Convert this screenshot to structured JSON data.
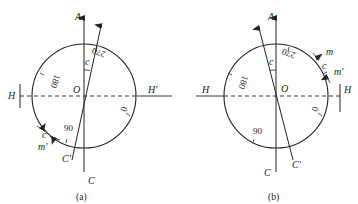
{
  "figures": [
    {
      "id": "a",
      "caption": "(a)",
      "labels": {
        "A": "A",
        "C": "C",
        "Cp": "C'",
        "H": "H",
        "Hp": "H'",
        "O": "O",
        "c_top": "c",
        "c_arc": "c",
        "mp": "m'"
      },
      "scale": {
        "s0": "0",
        "s90": "90",
        "s180": "180",
        "s270": "270"
      }
    },
    {
      "id": "b",
      "caption": "(b)",
      "labels": {
        "A": "A",
        "C": "C",
        "Cp": "C'",
        "H": "H",
        "Hr": "H",
        "O": "O",
        "c_top": "c",
        "c_arc": "c",
        "m": "m",
        "mp": "m'"
      },
      "scale": {
        "s0": "0",
        "s90": "90",
        "s180": "180",
        "s270": "270"
      }
    }
  ],
  "colors": {
    "stroke": "#222222",
    "background": "#ffffff"
  }
}
